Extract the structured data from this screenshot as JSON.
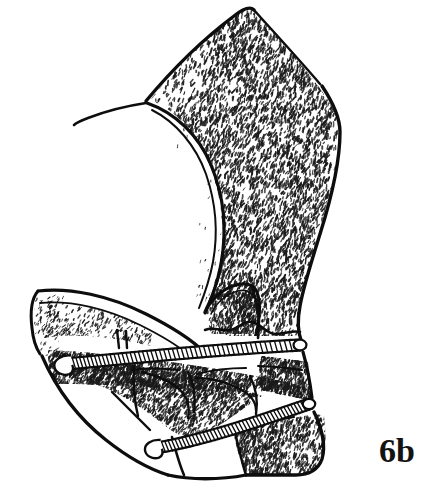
{
  "figure": {
    "panel_label": "6b",
    "caption_text": "",
    "background_color": "#ffffff",
    "ink_color": "#0d0d0d",
    "stipple_color": "#1a1a1a",
    "view_width": 429,
    "view_height": 496
  },
  "structures": {
    "main_body": {
      "name": "stippled main sclerite shaft",
      "texture": "dense comma stipple",
      "outline_weight": 3.2
    },
    "crescent_notch": {
      "name": "deep crescent concavity",
      "outline_weight": 3.0
    },
    "upper_arm": {
      "name": "curved left arm",
      "outline_weight": 2.8
    },
    "band_upper": {
      "name": "upper toothed transverse band",
      "teeth_count": 54,
      "knob_end": "left",
      "knob_shape": "rounded bulb"
    },
    "band_lower": {
      "name": "lower toothed transverse band",
      "teeth_count": 44,
      "knob_end": "left",
      "knob_shape": "rounded bulb"
    },
    "cells": {
      "name": "polygonal cell divisions",
      "count": 6
    },
    "terminal_lobe": {
      "name": "rounded terminal lobe",
      "outline_weight": 3.2
    },
    "apex_filament": {
      "name": "thin tapering apical filament"
    }
  },
  "stipple": {
    "density_dense": 0.92,
    "density_medium": 0.6,
    "density_sparse": 0.3,
    "dash_length_min": 1.6,
    "dash_length_max": 5.0,
    "dash_width_min": 0.9,
    "dash_width_max": 1.9
  },
  "colors": {
    "ink": "#0d0d0d",
    "paper": "#ffffff",
    "stipple": "#1a1a1a"
  }
}
